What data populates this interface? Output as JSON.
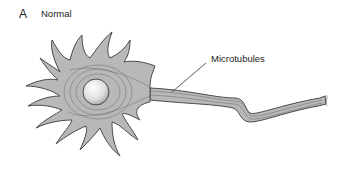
{
  "panel": {
    "letter": "A",
    "title": "Normal"
  },
  "labels": {
    "microtubules": "Microtubules"
  },
  "colors": {
    "cell_fill": "#b8b8b8",
    "outline": "#4a4a4a",
    "nucleus_fill": "#e8e8e8"
  }
}
